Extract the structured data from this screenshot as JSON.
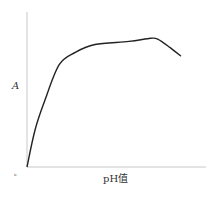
{
  "chart_data": {
    "type": "line",
    "title": "",
    "xlabel": "pH值",
    "ylabel": "A",
    "origin_label": "o",
    "grid": false,
    "legend": null,
    "x_ticks": [],
    "y_ticks": [],
    "xlim": [
      0,
      100
    ],
    "ylim": [
      0,
      100
    ],
    "series": [
      {
        "name": "A vs pH",
        "color": "#222222",
        "x": [
          0,
          4.5,
          10,
          18,
          27,
          38,
          57,
          69,
          73,
          80,
          86
        ],
        "y": [
          0,
          24,
          43,
          66,
          74,
          79,
          81,
          83,
          82.5,
          77,
          71.5
        ]
      }
    ]
  },
  "colors": {
    "axis": "#c8c8c8",
    "curve": "#222222",
    "text": "#333333"
  }
}
